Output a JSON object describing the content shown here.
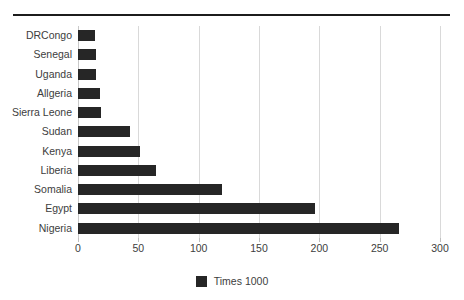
{
  "chart_data": {
    "type": "bar",
    "orientation": "horizontal",
    "title": "",
    "subtitle": "",
    "xlabel": "",
    "ylabel": "",
    "categories": [
      "DRCongo",
      "Senegal",
      "Uganda",
      "Allgeria",
      "Sierra Leone",
      "Sudan",
      "Kenya",
      "Liberia",
      "Somalia",
      "Egypt",
      "Nigeria"
    ],
    "values": [
      14,
      15,
      15,
      18,
      19,
      43,
      51,
      65,
      119,
      196,
      266
    ],
    "series": [
      {
        "name": "Times 1000",
        "values": [
          14,
          15,
          15,
          18,
          19,
          43,
          51,
          65,
          119,
          196,
          266
        ]
      }
    ],
    "xlim": [
      0,
      300
    ],
    "xticks": [
      0,
      50,
      100,
      150,
      200,
      250,
      300
    ],
    "xtick_labels": [
      "0",
      "50",
      "100",
      "150",
      "200",
      "250",
      "300"
    ],
    "grid": "vertical",
    "legend": {
      "position": "bottom",
      "entries": [
        {
          "label": "Times 1000",
          "color": "#262626"
        }
      ]
    },
    "bar_color": "#262626",
    "gridline_color": "#d9d9d9",
    "text_color": "#3d3d3d",
    "background_color": "#ffffff",
    "rule_color": "#1c1c1c"
  }
}
